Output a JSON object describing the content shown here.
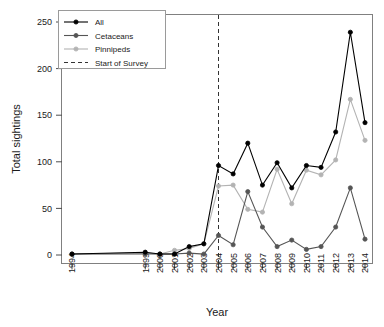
{
  "chart_data": {
    "type": "line",
    "title": "",
    "xlabel": "Year",
    "ylabel": "Total sightings",
    "xlim": [
      1993.2,
      2014.8
    ],
    "ylim": [
      0,
      258
    ],
    "grid": false,
    "legend_position": "top-left",
    "x": [
      1994,
      1999,
      2000,
      2001,
      2002,
      2003,
      2004,
      2005,
      2006,
      2007,
      2008,
      2009,
      2010,
      2011,
      2012,
      2013,
      2014
    ],
    "xtick_labels": [
      "1994",
      "1999",
      "2000",
      "2001",
      "2002",
      "2003",
      "2004",
      "2005",
      "2006",
      "2007",
      "2008",
      "2009",
      "2010",
      "2011",
      "2012",
      "2013",
      "2014"
    ],
    "ytick_labels": [
      "0",
      "50",
      "100",
      "150",
      "200",
      "250"
    ],
    "ytick_values": [
      0,
      50,
      100,
      150,
      200,
      250
    ],
    "series": [
      {
        "name": "All",
        "color": "#000000",
        "marker": "circle-filled",
        "values": [
          1,
          3,
          1,
          1,
          9,
          12,
          96,
          87,
          120,
          75,
          99,
          72,
          96,
          94,
          132,
          239,
          142
        ]
      },
      {
        "name": "Cetaceans",
        "color": "#555555",
        "marker": "circle-filled",
        "values": [
          1,
          1,
          1,
          1,
          2,
          1,
          21,
          11,
          68,
          30,
          9,
          16,
          6,
          9,
          30,
          72,
          17
        ]
      },
      {
        "name": "Pinnipeds",
        "color": "#b3b3b3",
        "marker": "circle-filled",
        "values": [
          1,
          2,
          1,
          5,
          7,
          12,
          74,
          75,
          49,
          46,
          92,
          55,
          91,
          86,
          102,
          167,
          123
        ]
      }
    ],
    "annotations": [
      {
        "name": "Start of Survey",
        "type": "vline-dashed",
        "x": 2004,
        "color": "#333333"
      }
    ],
    "legend_entries": [
      {
        "label": "All",
        "style": "line-marker",
        "color": "#000000"
      },
      {
        "label": "Cetaceans",
        "style": "line-marker",
        "color": "#555555"
      },
      {
        "label": "Pinnipeds",
        "style": "line-marker",
        "color": "#b3b3b3"
      },
      {
        "label": "Start of Survey",
        "style": "dashed-line",
        "color": "#333333"
      }
    ]
  }
}
